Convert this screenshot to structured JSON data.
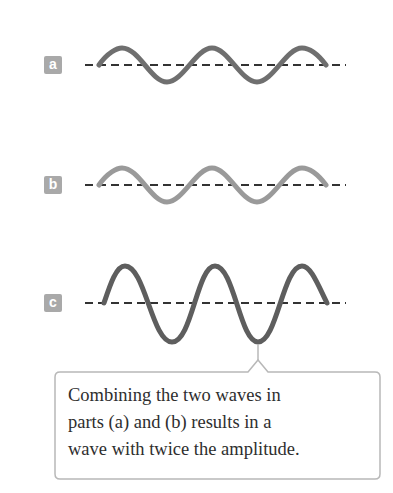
{
  "panels": [
    {
      "id": "a",
      "label": "a",
      "wave": "Wave a",
      "color": "#6f6f6f"
    },
    {
      "id": "b",
      "label": "b",
      "wave": "Wave b (in phase with a)",
      "color": "#9a9a9a"
    },
    {
      "id": "c",
      "label": "c",
      "wave": "Combined wave (double amplitude)",
      "color": "#5e5e5e"
    }
  ],
  "colors": {
    "label_bg": "#a9a9a9",
    "axis": "#333333",
    "callout_border": "#b8b8b8",
    "text": "#2e2e2e"
  },
  "callout": {
    "lines": [
      "Combining the two waves in",
      "parts (a) and (b) results in a",
      "wave with twice the amplitude."
    ]
  }
}
